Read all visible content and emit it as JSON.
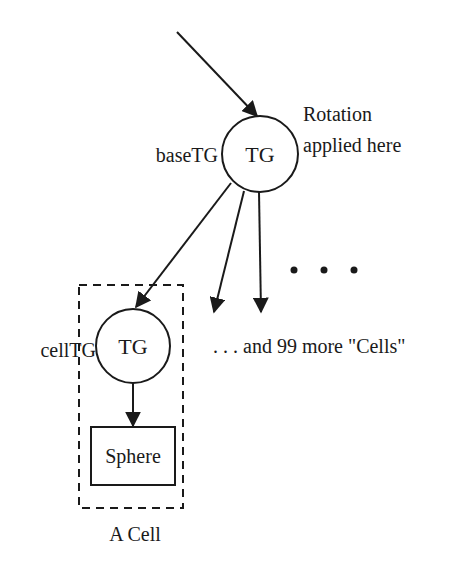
{
  "diagram": {
    "type": "scene-graph",
    "nodes": {
      "base": {
        "label": "TG",
        "name_label": "baseTG",
        "annotation_line1": "Rotation",
        "annotation_line2": "applied here"
      },
      "cell": {
        "label": "TG",
        "name_label": "cellTG"
      },
      "sphere": {
        "label": "Sphere"
      }
    },
    "ellipsis": "•   •   •",
    "more_cells_label": ". . . and 99 more \"Cells\"",
    "group_label": "A Cell",
    "edges": [
      {
        "from": "root",
        "to": "base"
      },
      {
        "from": "base",
        "to": "cell"
      },
      {
        "from": "base",
        "to": "cell-2"
      },
      {
        "from": "base",
        "to": "cell-3"
      },
      {
        "from": "cell",
        "to": "sphere"
      }
    ],
    "colors": {
      "stroke": "#1a1a1a",
      "background": "#ffffff"
    }
  }
}
